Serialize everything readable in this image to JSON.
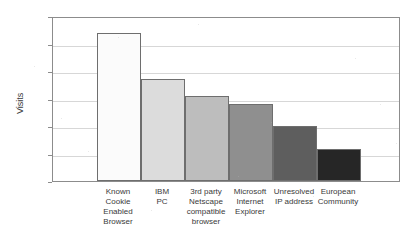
{
  "figure": {
    "title_clipped": "VISITS BY BROWSER AND DOMAIN CATEGORY",
    "background_color": "#ffffff",
    "frame_color": "#8c8c8c",
    "gridline_color": "#d7d7d7"
  },
  "chart_data": {
    "type": "bar",
    "title": "",
    "xlabel": "",
    "ylabel": "Visits",
    "ylim": [
      0,
      600
    ],
    "yticks": [
      0,
      100,
      200,
      300,
      400,
      500,
      600
    ],
    "ytick_labels": [
      "0",
      "100",
      "200",
      "300",
      "400",
      "500",
      "600"
    ],
    "grid": true,
    "grid_axis": "y",
    "legend": false,
    "orientation": "vertical",
    "bar_gap": 0,
    "categories": [
      "Known Cookie Enabled Browser",
      "IBM PC",
      "3rd party Netscape compatible browser",
      "Microsoft Internet Explorer",
      "Unresolved IP address",
      "European Community"
    ],
    "category_lines": [
      [
        "Known",
        "Cookie",
        "Enabled",
        "Browser"
      ],
      [
        "IBM",
        "PC"
      ],
      [
        "3rd party",
        "Netscape",
        "compatible",
        "browser"
      ],
      [
        "Microsoft",
        "Internet",
        "Explorer"
      ],
      [
        "Unresolved",
        "IP address"
      ],
      [
        "European",
        "Community"
      ]
    ],
    "values": [
      540,
      370,
      310,
      280,
      200,
      115
    ],
    "bar_colors": [
      "#fbfbfb",
      "#dcdcdc",
      "#bdbdbd",
      "#8f8f8f",
      "#5e5e5e",
      "#262626"
    ],
    "bar_edge_color": "#6e6e6e"
  }
}
